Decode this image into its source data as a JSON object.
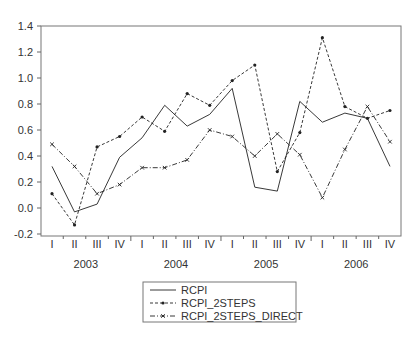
{
  "chart_data": {
    "type": "line",
    "title": "",
    "xlabel": "",
    "ylabel": "",
    "ylim": [
      -0.2,
      1.4
    ],
    "yticks": [
      -0.2,
      0.0,
      0.2,
      0.4,
      0.6,
      0.8,
      1.0,
      1.2,
      1.4
    ],
    "ytick_labels": [
      "-0.2",
      "0.0",
      "0.2",
      "0.4",
      "0.6",
      "0.8",
      "1.0",
      "1.2",
      "1.4"
    ],
    "grid": false,
    "legend_position": "bottom-center",
    "quarter_labels": [
      "I",
      "II",
      "III",
      "IV",
      "I",
      "II",
      "III",
      "IV",
      "I",
      "II",
      "III",
      "IV",
      "I",
      "II",
      "III",
      "IV"
    ],
    "year_labels": [
      "2003",
      "2004",
      "2005",
      "2006"
    ],
    "x": [
      "2003Q1",
      "2003Q2",
      "2003Q3",
      "2003Q4",
      "2004Q1",
      "2004Q2",
      "2004Q3",
      "2004Q4",
      "2005Q1",
      "2005Q2",
      "2005Q3",
      "2005Q4",
      "2006Q1",
      "2006Q2",
      "2006Q3",
      "2006Q4"
    ],
    "series": [
      {
        "name": "RCPI",
        "style": "solid",
        "marker": "none",
        "values": [
          0.32,
          -0.03,
          0.03,
          0.39,
          0.54,
          0.79,
          0.63,
          0.72,
          0.92,
          0.16,
          0.13,
          0.82,
          0.66,
          0.73,
          0.69,
          0.32
        ]
      },
      {
        "name": "RCPI_2STEPS",
        "style": "dashed",
        "marker": "dot",
        "values": [
          0.11,
          -0.13,
          0.47,
          0.55,
          0.7,
          0.59,
          0.88,
          0.79,
          0.98,
          1.1,
          0.28,
          0.58,
          1.31,
          0.78,
          0.69,
          0.75
        ]
      },
      {
        "name": "RCPI_2STEPS_DIRECT",
        "style": "dashdot",
        "marker": "x",
        "values": [
          0.49,
          0.32,
          0.11,
          0.18,
          0.31,
          0.31,
          0.37,
          0.6,
          0.55,
          0.4,
          0.57,
          0.41,
          0.08,
          0.45,
          0.78,
          0.51
        ]
      }
    ]
  },
  "legend": {
    "items": [
      {
        "label": "RCPI"
      },
      {
        "label": "RCPI_2STEPS"
      },
      {
        "label": "RCPI_2STEPS_DIRECT"
      }
    ]
  },
  "colors": {
    "line": "#222222",
    "axis": "#666666",
    "text": "#333333",
    "background": "#ffffff"
  }
}
